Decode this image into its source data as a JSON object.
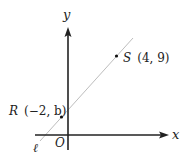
{
  "diagram": {
    "type": "coordinate-plane",
    "axes": {
      "x_label": "x",
      "y_label": "y",
      "origin_label": "O"
    },
    "line": {
      "label": "ℓ",
      "color": "#bdbdbd"
    },
    "points": [
      {
        "name": "R",
        "coords": "(−2, b)",
        "x": "−2",
        "y": "b"
      },
      {
        "name": "S",
        "coords": "(4, 9)",
        "x": "4",
        "y": "9"
      }
    ],
    "colors": {
      "axis": "#222222",
      "line": "#bdbdbd",
      "text": "#222222"
    }
  }
}
